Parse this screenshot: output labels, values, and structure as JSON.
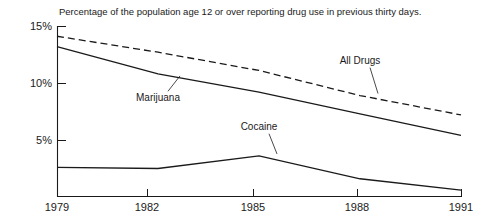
{
  "chart_data": {
    "type": "line",
    "title": "Percentage of the population age 12 or over reporting drug use in previous thirty days.",
    "xlabel": "",
    "ylabel": "",
    "x": [
      1979,
      1982,
      1985,
      1988,
      1991
    ],
    "categories": [
      "1979",
      "1982",
      "1985",
      "1988",
      "1991"
    ],
    "xlim": [
      1979,
      1991
    ],
    "ylim": [
      0,
      15
    ],
    "yticks": [
      5,
      10,
      15
    ],
    "ytick_labels": [
      "5%",
      "10%",
      "15%"
    ],
    "xticks": [
      1979,
      1982,
      1985,
      1988,
      1991
    ],
    "xtick_labels": [
      "1979",
      "1982",
      "1985",
      "1988",
      "1991"
    ],
    "grid": false,
    "legend": "inline-annotations",
    "series": [
      {
        "name": "All Drugs",
        "style": "dashed",
        "color": "#1a1a1a",
        "values": [
          14.1,
          12.7,
          11.1,
          8.9,
          7.2
        ],
        "label_x": 1988,
        "label_y": 11.7
      },
      {
        "name": "Marijuana",
        "style": "solid",
        "color": "#1a1a1a",
        "values": [
          13.2,
          10.8,
          9.2,
          7.3,
          5.4
        ],
        "label_x": 1982,
        "label_y": 8.4
      },
      {
        "name": "Cocaine",
        "style": "solid",
        "color": "#1a1a1a",
        "values": [
          2.6,
          2.5,
          3.6,
          1.6,
          0.6
        ],
        "label_x": 1985,
        "label_y": 5.9
      }
    ]
  },
  "axes": {
    "y_tick_15": "15%",
    "y_tick_10": "10%",
    "y_tick_5": "5%",
    "x_tick_1979": "1979",
    "x_tick_1982": "1982",
    "x_tick_1985": "1985",
    "x_tick_1988": "1988",
    "x_tick_1991": "1991"
  },
  "annotations": {
    "all_drugs": "All Drugs",
    "marijuana": "Marijuana",
    "cocaine": "Cocaine"
  },
  "colors": {
    "ink": "#1a1a1a",
    "background": "#ffffff"
  }
}
